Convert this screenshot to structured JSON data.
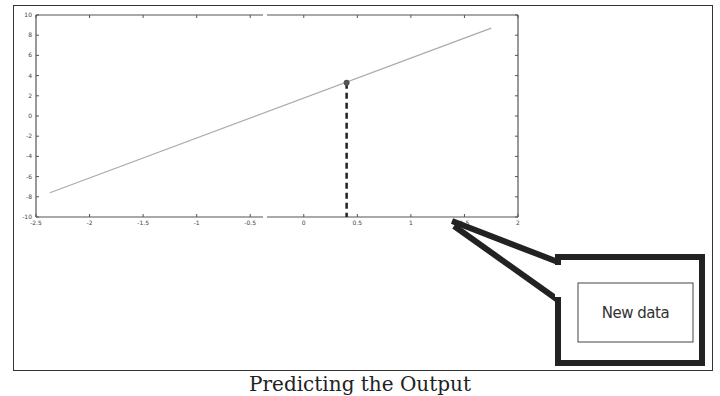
{
  "chart_data": {
    "type": "line",
    "title": "",
    "xlabel": "",
    "ylabel": "",
    "xlim": [
      -2.5,
      2
    ],
    "ylim": [
      -10,
      10
    ],
    "x_ticks": [
      -2.5,
      -2,
      -1.5,
      -1,
      -0.5,
      0,
      0.5,
      1,
      1.5,
      2
    ],
    "x_tick_labels": [
      "-2.5",
      "-2",
      "-1.5",
      "-1",
      "-0.5",
      "0",
      "0.5",
      "1",
      "1.5",
      "2"
    ],
    "y_ticks": [
      10,
      8,
      6,
      4,
      2,
      0,
      -2,
      -4,
      -6,
      -8,
      -10
    ],
    "y_tick_labels": [
      "10",
      "8",
      "6",
      "4",
      "2",
      "0",
      "-2",
      "-4",
      "-6",
      "-8",
      "-10"
    ],
    "grid": false,
    "series": [
      {
        "name": "regression line",
        "x": [
          -2.37,
          1.75
        ],
        "y": [
          -7.6,
          8.7
        ],
        "color": "#aaaaaa"
      }
    ],
    "highlight_point": {
      "x": 0.4,
      "y": 3.3,
      "drop_line": "dashed"
    },
    "annotations": [
      {
        "text": "New data",
        "type": "callout",
        "points_to": {
          "x": 1.5,
          "y": -10
        }
      }
    ]
  },
  "callout": {
    "label": "New data"
  },
  "caption": "Predicting the Output"
}
